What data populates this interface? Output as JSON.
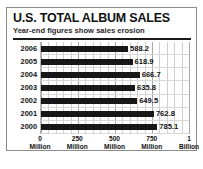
{
  "chart_data": {
    "type": "bar",
    "orientation": "horizontal",
    "title": "U.S. TOTAL ALBUM SALES",
    "subtitle": "Year-end figures show sales erosion",
    "categories": [
      "2006",
      "2005",
      "2004",
      "2003",
      "2002",
      "2001",
      "2000"
    ],
    "values": [
      588.2,
      618.9,
      666.7,
      635.8,
      649.5,
      762.8,
      785.1
    ],
    "value_labels": [
      "588.2",
      "618.9",
      "666.7",
      "635.8",
      "649.5",
      "762.8",
      "785.1"
    ],
    "units": "millions of albums",
    "xlabel": "",
    "ylabel": "",
    "xlim": [
      0,
      1000
    ],
    "xticks": [
      {
        "value": 0,
        "num": "0",
        "unit": "Million"
      },
      {
        "value": 250,
        "num": "250",
        "unit": "Million"
      },
      {
        "value": 500,
        "num": "500",
        "unit": "Million"
      },
      {
        "value": 750,
        "num": "750",
        "unit": "Million"
      },
      {
        "value": 1000,
        "num": "1",
        "unit": "Billion"
      }
    ],
    "grid": true,
    "legend": null,
    "colors": {
      "bar": "#17171a",
      "grid": "#cfcfcf",
      "text": "#111111",
      "frame": "#8c8c8c",
      "rule": "#1a1a1a",
      "background": "#ffffff"
    }
  }
}
